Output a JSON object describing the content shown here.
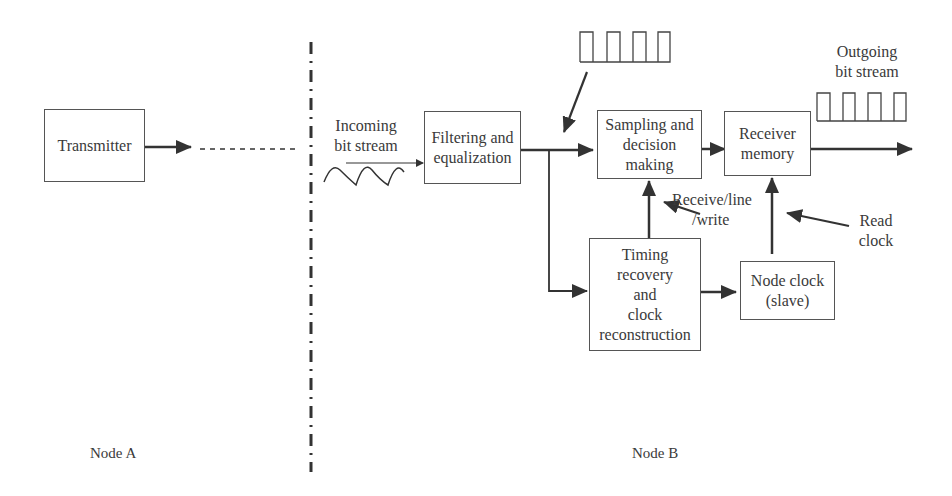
{
  "diagram": {
    "type": "block-diagram",
    "blocks": {
      "transmitter": "Transmitter",
      "filtering": [
        "Filtering and",
        "equalization"
      ],
      "sampling": [
        "Sampling and",
        "decision",
        "making"
      ],
      "receiver_memory": [
        "Receiver",
        "memory"
      ],
      "timing": [
        "Timing",
        "recovery",
        "and",
        "clock",
        "reconstruction"
      ],
      "node_clock": [
        "Node clock",
        "(slave)"
      ]
    },
    "annotations": {
      "incoming": [
        "Incoming",
        "bit stream"
      ],
      "outgoing": [
        "Outgoing",
        "bit stream"
      ],
      "receive_line_write": [
        "Receive/line",
        "/write"
      ],
      "read_clock": [
        "Read",
        "clock"
      ]
    },
    "nodes": {
      "a": "Node A",
      "b": "Node B"
    },
    "colors": {
      "line": "#333333",
      "text": "#3a3a3a",
      "background": "#ffffff"
    }
  }
}
